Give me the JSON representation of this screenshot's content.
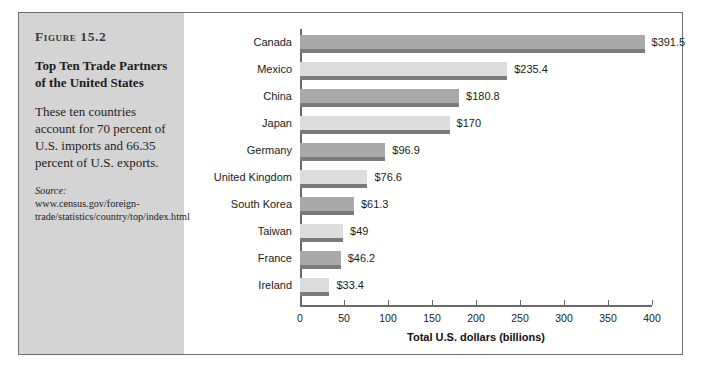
{
  "figure": {
    "number": "Figure 15.2",
    "title": "Top Ten Trade Partners of the United States",
    "description": "These ten countries account for 70 percent of U.S. imports and 66.35 percent of U.S. exports.",
    "source_label": "Source:",
    "source_url": "www.census.gov/foreign-trade/statistics/country/top/index.html"
  },
  "colors": {
    "panel_background": "#d4d4d4",
    "frame_border": "#6f6f6f",
    "bar_dark": "#a9a9a9",
    "bar_light": "#dcdcdc",
    "bar_shadow": "#7b7b7b",
    "axis": "#6a6a6a"
  },
  "chart_data": {
    "type": "bar",
    "orientation": "horizontal",
    "title": "Top Ten Trade Partners of the United States",
    "xlabel": "Total U.S. dollars (billions)",
    "ylabel": "",
    "xlim": [
      0,
      400
    ],
    "xticks": [
      0,
      50,
      100,
      150,
      200,
      250,
      300,
      350,
      400
    ],
    "grid": false,
    "legend": null,
    "categories": [
      "Canada",
      "Mexico",
      "China",
      "Japan",
      "Germany",
      "United Kingdom",
      "South Korea",
      "Taiwan",
      "France",
      "Ireland"
    ],
    "values": [
      391.5,
      235.4,
      180.8,
      170,
      96.9,
      76.6,
      61.3,
      49,
      46.2,
      33.4
    ],
    "data_labels": [
      "$391.5",
      "$235.4",
      "$180.8",
      "$170",
      "$96.9",
      "$76.6",
      "$61.3",
      "$49",
      "$46.2",
      "$33.4"
    ]
  }
}
